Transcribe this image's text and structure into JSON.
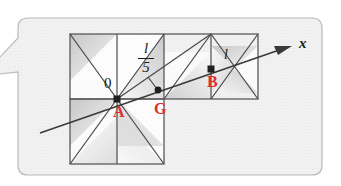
{
  "figure": {
    "kind": "geometry-diagram-callout",
    "callout_bubble": {
      "fill": "#f2f2f2",
      "border": "#b9b9b9",
      "tail_direction": "left"
    },
    "colors": {
      "point_label_red": "#d9302c",
      "plain_label_black": "#1a1a1a",
      "line": "#4a4a4a",
      "grid_line": "#5a5a5a",
      "shade_light": "#f6f6f6",
      "shade_dark": "#c9c9c9",
      "background": "#f2f2f2"
    },
    "grid": {
      "cell_size": 47,
      "top_row_squares": 4,
      "bottom_row_squares": 2,
      "origin_x": 70,
      "origin_y": 34
    },
    "points": [
      {
        "name": "A",
        "label": "A",
        "color": "red",
        "x": 117,
        "y": 99,
        "note": "origin point marked 0"
      },
      {
        "name": "G",
        "label": "G",
        "color": "red",
        "x": 158,
        "y": 90
      },
      {
        "name": "B",
        "label": "B",
        "color": "red",
        "x": 211,
        "y": 69
      }
    ],
    "labels": {
      "origin": "0",
      "point_a": "A",
      "point_g": "G",
      "point_b": "B",
      "axis_x": "x",
      "length_b": "l",
      "fraction_numerator": "l",
      "fraction_denominator": "5"
    },
    "axis": {
      "name": "x",
      "arrow_label": "x",
      "from_x": 40,
      "from_y": 133,
      "to_x": 292,
      "to_y": 46
    }
  }
}
